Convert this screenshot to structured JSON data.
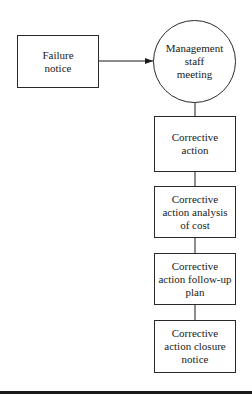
{
  "diagram": {
    "nodes": [
      {
        "id": "failure-notice",
        "shape": "rect",
        "label": "Failure\nnotice"
      },
      {
        "id": "management-staff-meeting",
        "shape": "circle",
        "label": "Management\nstaff\nmeeting"
      },
      {
        "id": "corrective-action",
        "shape": "rect",
        "label": "Corrective\naction"
      },
      {
        "id": "corrective-action-analysis-of-cost",
        "shape": "rect",
        "label": "Corrective\naction analysis\nof cost"
      },
      {
        "id": "corrective-action-follow-up-plan",
        "shape": "rect",
        "label": "Corrective\naction follow-up\nplan"
      },
      {
        "id": "corrective-action-closure-notice",
        "shape": "rect",
        "label": "Corrective\naction closure\nnotice"
      }
    ],
    "edges": [
      {
        "from": "failure-notice",
        "to": "management-staff-meeting",
        "style": "arrow"
      },
      {
        "from": "management-staff-meeting",
        "to": "corrective-action",
        "style": "line"
      },
      {
        "from": "corrective-action",
        "to": "corrective-action-analysis-of-cost",
        "style": "line"
      },
      {
        "from": "corrective-action-analysis-of-cost",
        "to": "corrective-action-follow-up-plan",
        "style": "line"
      },
      {
        "from": "corrective-action-follow-up-plan",
        "to": "corrective-action-closure-notice",
        "style": "line"
      }
    ]
  }
}
